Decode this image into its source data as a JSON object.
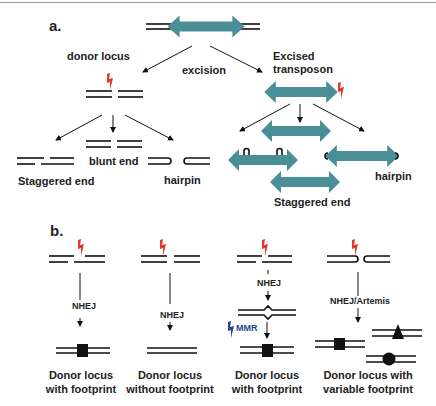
{
  "figure": {
    "colors": {
      "transposon": "#4a8e98",
      "lightning": "#e8372a",
      "mmr_lightning": "#2b3f96",
      "lines": "#111111",
      "text": "#222222"
    },
    "panel_a": {
      "label": "a.",
      "donor_locus": "donor locus",
      "excision": "excision",
      "excised_transposon_line1": "Excised",
      "excised_transposon_line2": "transposon",
      "left_ends": {
        "staggered": "Staggered end",
        "blunt": "blunt end",
        "hairpin": "hairpin"
      },
      "right_ends": {
        "hairpin": "hairpin",
        "staggered": "Staggered end"
      }
    },
    "panel_b": {
      "label": "b.",
      "columns": [
        {
          "pathway": "NHEJ",
          "result_line1": "Donor locus",
          "result_line2": "with footprint"
        },
        {
          "pathway": "NHEJ",
          "result_line1": "Donor locus",
          "result_line2": "without footprint"
        },
        {
          "pathway": "NHEJ",
          "repair": "MMR",
          "result_line1": "Donor locus",
          "result_line2": "with footprint"
        },
        {
          "pathway": "NHEJ/Artemis",
          "result_line1": "Donor locus with",
          "result_line2": "variable footprint"
        }
      ]
    }
  }
}
